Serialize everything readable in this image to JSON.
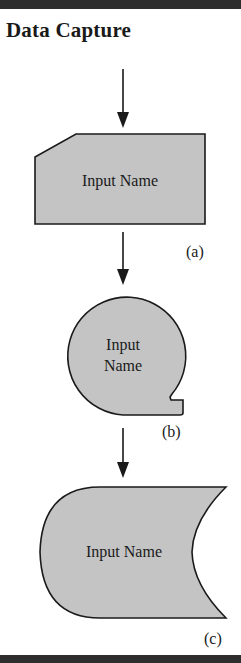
{
  "title": "Data Capture",
  "colors": {
    "shape_fill": "#c4c4c4",
    "stroke": "#1a1a1a",
    "bar": "#2e2e2e"
  },
  "shapes": [
    {
      "id": "a",
      "kind": "manual-input",
      "text": "Input Name",
      "label": "(a)"
    },
    {
      "id": "b",
      "kind": "circle-with-notch",
      "text_line1": "Input",
      "text_line2": "Name",
      "label": "(b)"
    },
    {
      "id": "c",
      "kind": "stored-data",
      "text": "Input Name",
      "label": "(c)"
    }
  ]
}
